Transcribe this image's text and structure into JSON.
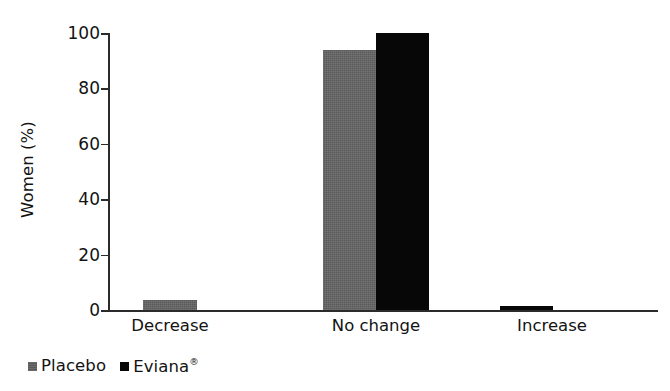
{
  "chart_data": {
    "type": "bar",
    "title": "",
    "subtitle": "",
    "xlabel": "",
    "ylabel": "Women (%)",
    "categories": [
      "Decrease",
      "No change",
      "Increase"
    ],
    "series": [
      {
        "name": "Placebo",
        "color": "#5a5a5a",
        "values": [
          3.5,
          94,
          0
        ]
      },
      {
        "name": "Eviana®",
        "color": "#070707",
        "values": [
          0,
          100,
          1.5
        ]
      }
    ],
    "yticks": [
      0,
      20,
      40,
      60,
      80,
      100
    ],
    "ytick_labels": [
      "0",
      "20",
      "40",
      "60",
      "80",
      "100"
    ],
    "ylim": [
      0,
      100
    ],
    "grid": false,
    "legend_position": "bottom-left",
    "annotations": []
  },
  "legend": {
    "items": [
      {
        "label": "Placebo",
        "mark": "",
        "swatch": "gray",
        "icon": "square-marker-icon"
      },
      {
        "label": "Eviana",
        "mark": "®",
        "swatch": "black",
        "icon": "square-marker-icon"
      }
    ]
  },
  "axes": {
    "y_title": "Women (%)",
    "y_tick_0": "0",
    "y_tick_1": "20",
    "y_tick_2": "40",
    "y_tick_3": "60",
    "y_tick_4": "80",
    "y_tick_5": "100",
    "x_cat_0": "Decrease",
    "x_cat_1": "No change",
    "x_cat_2": "Increase"
  }
}
